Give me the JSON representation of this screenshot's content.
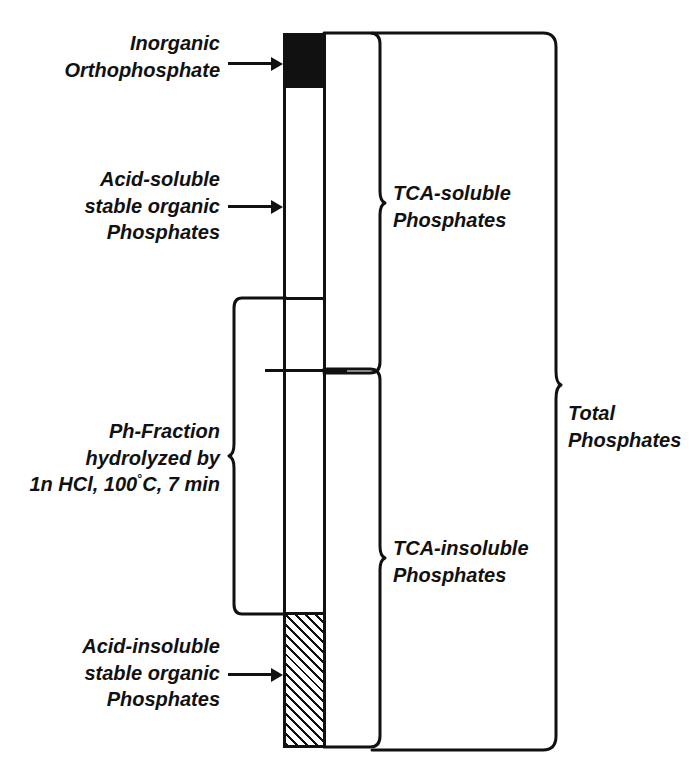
{
  "diagram": {
    "ink_color": "#111111",
    "background_color": "#ffffff"
  },
  "left_labels": [
    {
      "name": "inorganic-orthophosphate",
      "lines": [
        "Inorganic",
        "Orthophosphate"
      ],
      "points_to": "black-segment",
      "connector": "arrow"
    },
    {
      "name": "acid-soluble-stable-organic-phosphates",
      "lines": [
        "Acid-soluble",
        "stable organic",
        "Phosphates"
      ],
      "points_to": "white-upper-segment",
      "connector": "arrow"
    },
    {
      "name": "ph-fraction-hydrolyzed",
      "lines": [
        "Ph-Fraction",
        "hydrolyzed by",
        "1n HCl, 100°C, 7 min"
      ],
      "line3_prefix": "1n HCl, 100",
      "line3_degree": "°",
      "line3_suffix": "C, 7 min",
      "points_to": "mid-segment",
      "connector": "brace-left"
    },
    {
      "name": "acid-insoluble-stable-organic-phosphates",
      "lines": [
        "Acid-insoluble",
        "stable organic",
        "Phosphates"
      ],
      "points_to": "hatched-segment",
      "connector": "arrow"
    }
  ],
  "right_labels": [
    {
      "name": "tca-soluble-phosphates",
      "lines": [
        "TCA-soluble",
        "Phosphates"
      ],
      "connector": "brace-right"
    },
    {
      "name": "tca-insoluble-phosphates",
      "lines": [
        "TCA-insoluble",
        "Phosphates"
      ],
      "connector": "brace-right"
    },
    {
      "name": "total-phosphates",
      "lines": [
        "Total",
        "Phosphates"
      ],
      "connector": "brace-right"
    }
  ],
  "column": {
    "name": "phosphate-column",
    "segments": [
      {
        "name": "inorganic-orthophosphate-segment",
        "fill": "solid-black",
        "top_px": 33,
        "height_px": 55
      },
      {
        "name": "acid-soluble-segment",
        "fill": "white",
        "top_px": 88,
        "height_px": 212
      },
      {
        "name": "hydrolyzable-segment",
        "fill": "white",
        "top_px": 300,
        "height_px": 312
      },
      {
        "name": "acid-insoluble-segment",
        "fill": "diagonal-hatch",
        "top_px": 612,
        "height_px": 136
      }
    ],
    "boundaries": [
      {
        "name": "acid-soluble-lower-boundary",
        "y_px": 300
      },
      {
        "name": "tca-soluble-insoluble-boundary",
        "y_px": 369
      }
    ]
  }
}
